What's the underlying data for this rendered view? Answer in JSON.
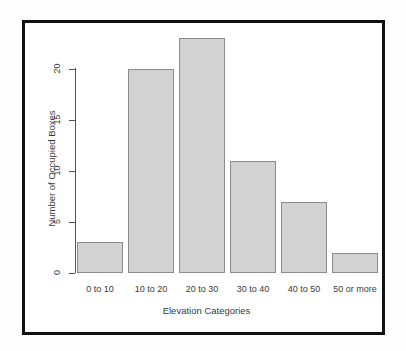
{
  "chart_data": {
    "type": "bar",
    "title": "",
    "subtitle": "",
    "xlabel": "Elevation Categories",
    "ylabel": "Number of Occupied Boxes",
    "categories": [
      "0 to 10",
      "10 to 20",
      "20 to 30",
      "30 to 40",
      "40 to 50",
      "50 or more"
    ],
    "values": [
      3,
      20,
      23,
      11,
      7,
      2
    ],
    "ylim": [
      0,
      23
    ],
    "yticks": [
      0,
      5,
      10,
      15,
      20
    ],
    "ytick_labels": [
      "0",
      "5",
      "10",
      "15",
      "20"
    ],
    "grid": false,
    "legend": null,
    "annotations": [],
    "style": {
      "bar_fill": "#d2d2d2",
      "bar_border": "#8c8c8c",
      "axis_color": "#555555",
      "text_color": "#3a3a3a",
      "frame_color": "#111111",
      "background": "#ffffff"
    }
  }
}
